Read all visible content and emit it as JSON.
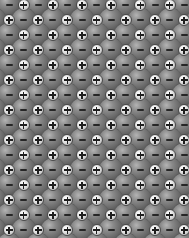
{
  "image": {
    "subject": "ionic crystal lattice (rock-salt arrangement) of alternating anions and cations",
    "width": 189,
    "height": 238
  },
  "lattice": {
    "cell_px_x": 14.6,
    "cell_px_y": 15.0,
    "origin_x": 9,
    "origin_y": 5,
    "rows": 17,
    "cols": 14,
    "anion": {
      "sign": "−",
      "label": "negative ion",
      "color": "#6a6a6a",
      "diameter": 24
    },
    "cation": {
      "sign": "+",
      "label": "positive ion",
      "color": "#e0e0e0",
      "diameter": 12
    },
    "pattern": "checkerboard: anion where (row+col) even, cation where odd"
  }
}
